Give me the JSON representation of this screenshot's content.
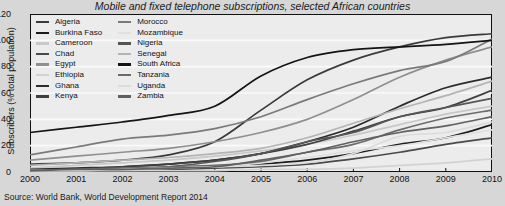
{
  "chart_data": {
    "type": "line",
    "title": "Mobile and fixed telephone subscriptions, selected African countries",
    "xlabel": "",
    "ylabel": "Subscribers (% total population)",
    "ylim": [
      0,
      120
    ],
    "xlim": [
      2000,
      2010
    ],
    "yticks": [
      0,
      20,
      40,
      60,
      80,
      100,
      120
    ],
    "x": [
      2000,
      2001,
      2002,
      2003,
      2004,
      2005,
      2006,
      2007,
      2008,
      2009,
      2010
    ],
    "grid": true,
    "legend_position": "top-left",
    "legend_columns": 2,
    "source": "Source: World Bank, World Development Report 2014",
    "series": [
      {
        "name": "Algeria",
        "color": "#3a3a3a",
        "values": [
          6,
          7,
          9,
          13,
          23,
          47,
          70,
          85,
          95,
          102,
          105
        ]
      },
      {
        "name": "Burkina Faso",
        "color": "#1c1c1c",
        "values": [
          1,
          2,
          2,
          3,
          4,
          6,
          9,
          14,
          21,
          26,
          36
        ]
      },
      {
        "name": "Cameroon",
        "color": "#c8c8c8",
        "values": [
          3,
          5,
          7,
          9,
          12,
          16,
          21,
          28,
          36,
          44,
          50
        ]
      },
      {
        "name": "Chad",
        "color": "#4a4a4a",
        "values": [
          1,
          1,
          1,
          2,
          3,
          4,
          6,
          10,
          15,
          21,
          26
        ]
      },
      {
        "name": "Egypt",
        "color": "#8f8f8f",
        "values": [
          9,
          12,
          15,
          18,
          23,
          30,
          40,
          55,
          72,
          85,
          95
        ]
      },
      {
        "name": "Ethiopia",
        "color": "#d2d2d2",
        "values": [
          1,
          1,
          1,
          1,
          1,
          2,
          2,
          3,
          5,
          7,
          10
        ]
      },
      {
        "name": "Ghana",
        "color": "#2b2b2b",
        "values": [
          2,
          3,
          4,
          6,
          9,
          14,
          23,
          34,
          50,
          64,
          72
        ]
      },
      {
        "name": "Kenya",
        "color": "#3f3f3f",
        "values": [
          1,
          2,
          4,
          6,
          9,
          14,
          21,
          31,
          42,
          49,
          62
        ]
      },
      {
        "name": "Morocco",
        "color": "#7a7a7a",
        "values": [
          13,
          19,
          25,
          28,
          33,
          42,
          55,
          67,
          77,
          84,
          101
        ]
      },
      {
        "name": "Mozambique",
        "color": "#e0e0e0",
        "values": [
          1,
          1,
          2,
          3,
          4,
          7,
          11,
          16,
          20,
          26,
          32
        ]
      },
      {
        "name": "Nigeria",
        "color": "#555555",
        "values": [
          1,
          1,
          2,
          4,
          8,
          14,
          23,
          30,
          42,
          49,
          56
        ]
      },
      {
        "name": "Senegal",
        "color": "#b4b4b4",
        "values": [
          5,
          7,
          9,
          11,
          14,
          18,
          26,
          37,
          48,
          58,
          69
        ]
      },
      {
        "name": "South Africa",
        "color": "#141414",
        "values": [
          30,
          34,
          38,
          43,
          50,
          73,
          87,
          93,
          95,
          97,
          100
        ]
      },
      {
        "name": "Tanzania",
        "color": "#6b6b6b",
        "values": [
          1,
          2,
          3,
          4,
          5,
          8,
          15,
          21,
          32,
          41,
          47
        ]
      },
      {
        "name": "Uganda",
        "color": "#dcdcdc",
        "values": [
          1,
          1,
          2,
          3,
          4,
          5,
          7,
          14,
          27,
          30,
          38
        ]
      },
      {
        "name": "Zambia",
        "color": "#606060",
        "values": [
          1,
          2,
          2,
          3,
          4,
          9,
          15,
          23,
          30,
          35,
          42
        ]
      }
    ]
  },
  "legend": {
    "column_left": [
      "Algeria",
      "Burkina Faso",
      "Cameroon",
      "Chad",
      "Egypt",
      "Ethiopia",
      "Ghana",
      "Kenya"
    ],
    "column_right": [
      "Morocco",
      "Mozambique",
      "Nigeria",
      "Senegal",
      "South Africa",
      "Tanzania",
      "Uganda",
      "Zambia"
    ]
  }
}
